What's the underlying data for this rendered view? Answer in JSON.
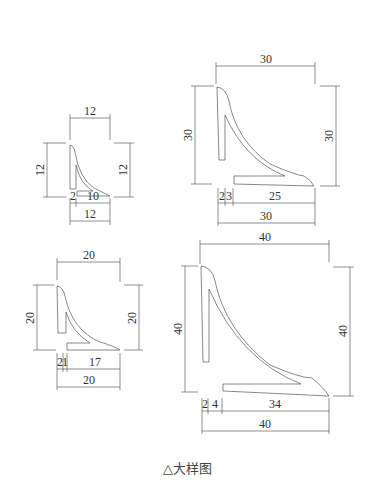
{
  "caption": "△大样图",
  "details": [
    {
      "id": "detail-12",
      "overall": "12",
      "height_left": "12",
      "height_right": "12",
      "bottom_parts": [
        "2",
        "10"
      ],
      "bottom_total": "12"
    },
    {
      "id": "detail-20",
      "overall": "20",
      "height_left": "20",
      "height_right": "20",
      "bottom_parts": [
        "2",
        "1",
        "17"
      ],
      "bottom_total": "20"
    },
    {
      "id": "detail-30",
      "overall": "30",
      "height_left": "30",
      "height_right": "30",
      "bottom_parts": [
        "2",
        "3",
        "25"
      ],
      "bottom_total": "30"
    },
    {
      "id": "detail-40",
      "overall": "40",
      "height_left": "40",
      "height_right": "40",
      "bottom_parts": [
        "2",
        "4",
        "34"
      ],
      "bottom_total": "40"
    }
  ],
  "colors": {
    "line": "#555555",
    "text": "#333333",
    "background": "#ffffff"
  }
}
